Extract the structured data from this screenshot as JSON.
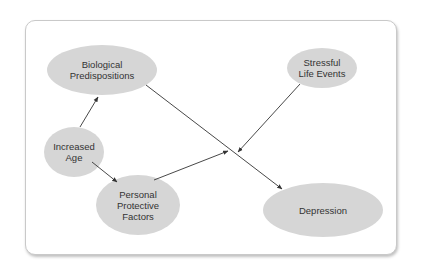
{
  "diagram": {
    "type": "causal-path-diagram",
    "colors": {
      "node_fill": "#d6d6d6",
      "edge": "#333333",
      "text": "#333333",
      "card_border": "#c9c9c9"
    },
    "nodes": [
      {
        "id": "bio",
        "label": "Biological\nPredispositions"
      },
      {
        "id": "stress",
        "label": "Stressful\nLife Events"
      },
      {
        "id": "age",
        "label": "Increased\nAge"
      },
      {
        "id": "ppf",
        "label": "Personal\nProtective\nFactors"
      },
      {
        "id": "dep",
        "label": "Depression"
      }
    ],
    "edges": [
      {
        "from": "age",
        "to": "bio"
      },
      {
        "from": "age",
        "to": "ppf"
      },
      {
        "from": "bio",
        "to": "dep"
      },
      {
        "from": "stress",
        "to": "bio->dep",
        "note": "moderates path"
      },
      {
        "from": "ppf",
        "to": "bio->dep",
        "note": "moderates path"
      }
    ]
  }
}
